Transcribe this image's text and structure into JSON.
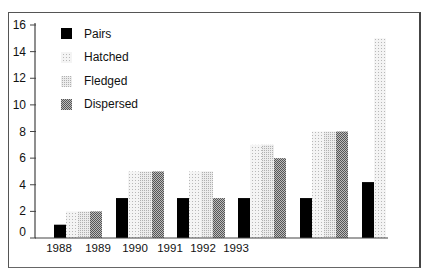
{
  "chart_data": {
    "type": "bar",
    "title": "",
    "xlabel": "",
    "ylabel": "",
    "ylim": [
      0,
      16
    ],
    "yticks": [
      0,
      2,
      4,
      6,
      8,
      10,
      12,
      14,
      16
    ],
    "grid": false,
    "legend_position": "top-left",
    "categories": [
      "1988",
      "1989",
      "1990",
      "1991",
      "1992",
      "1993"
    ],
    "x_tick_labels": [
      "1988",
      "1989",
      "1990",
      "1991",
      "1992",
      "1993"
    ],
    "series": [
      {
        "name": "Pairs",
        "pattern": "solid-black",
        "values": [
          1,
          3,
          3,
          3,
          3,
          4.2
        ]
      },
      {
        "name": "Hatched",
        "pattern": "light-dots",
        "values": [
          2,
          5,
          5,
          7,
          8,
          15
        ]
      },
      {
        "name": "Fledged",
        "pattern": "medium-dots",
        "values": [
          2,
          5,
          5,
          7,
          8,
          null
        ]
      },
      {
        "name": "Dispersed",
        "pattern": "dark-checker",
        "values": [
          2,
          5,
          3,
          6,
          8,
          null
        ]
      }
    ]
  },
  "colors": {
    "pairs": "#000000",
    "hatched": "#e8e8e8",
    "fledged": "#d6d6d6",
    "dispersed": "#8a8a8a",
    "axis": "#444444"
  }
}
